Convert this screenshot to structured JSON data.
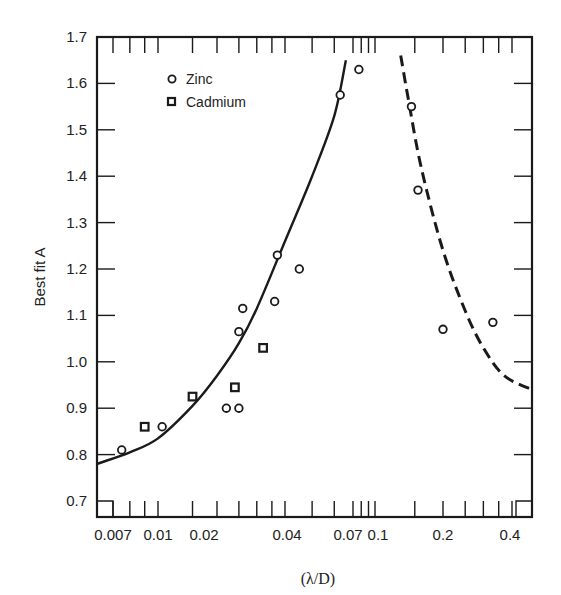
{
  "chart_data": {
    "type": "scatter",
    "title": "",
    "xlabel": "(λ/D)",
    "ylabel": "Best fit A",
    "xscale": "log",
    "xlim": [
      0.0063,
      0.47
    ],
    "ylim": [
      0.67,
      1.7
    ],
    "grid": false,
    "legend_position": "upper-left",
    "x_tick_labels": [
      "0.007",
      "0.01",
      "0.02",
      "0.04",
      "0.07",
      "0.1",
      "0.2",
      "0.4"
    ],
    "y_tick_labels": [
      "0.7",
      "0.8",
      "0.9",
      "1.0",
      "1.1",
      "1.2",
      "1.3",
      "1.4",
      "1.5",
      "1.6",
      "1.7"
    ],
    "legend": [
      {
        "label": "Zinc",
        "marker": "circle"
      },
      {
        "label": "Cadmium",
        "marker": "square"
      }
    ],
    "series": [
      {
        "name": "Zinc",
        "marker": "circle",
        "points": [
          {
            "x": 0.0075,
            "y": 0.81
          },
          {
            "x": 0.0105,
            "y": 0.86
          },
          {
            "x": 0.022,
            "y": 0.9
          },
          {
            "x": 0.025,
            "y": 0.9
          },
          {
            "x": 0.025,
            "y": 1.065
          },
          {
            "x": 0.026,
            "y": 1.115
          },
          {
            "x": 0.036,
            "y": 1.13
          },
          {
            "x": 0.037,
            "y": 1.23
          },
          {
            "x": 0.045,
            "y": 1.2
          },
          {
            "x": 0.063,
            "y": 1.575
          },
          {
            "x": 0.077,
            "y": 1.63
          },
          {
            "x": 0.145,
            "y": 1.55
          },
          {
            "x": 0.155,
            "y": 1.37
          },
          {
            "x": 0.2,
            "y": 1.07
          },
          {
            "x": 0.33,
            "y": 1.085
          }
        ]
      },
      {
        "name": "Cadmium",
        "marker": "square",
        "points": [
          {
            "x": 0.009,
            "y": 0.86
          },
          {
            "x": 0.015,
            "y": 0.925
          },
          {
            "x": 0.024,
            "y": 0.945
          },
          {
            "x": 0.032,
            "y": 1.03
          }
        ]
      },
      {
        "name": "Fit (small λ/D)",
        "style": "solid-line",
        "points": [
          {
            "x": 0.0063,
            "y": 0.78
          },
          {
            "x": 0.008,
            "y": 0.805
          },
          {
            "x": 0.01,
            "y": 0.835
          },
          {
            "x": 0.015,
            "y": 0.905
          },
          {
            "x": 0.02,
            "y": 0.97
          },
          {
            "x": 0.025,
            "y": 1.04
          },
          {
            "x": 0.03,
            "y": 1.115
          },
          {
            "x": 0.04,
            "y": 1.26
          },
          {
            "x": 0.05,
            "y": 1.4
          },
          {
            "x": 0.06,
            "y": 1.53
          },
          {
            "x": 0.066,
            "y": 1.65
          }
        ]
      },
      {
        "name": "Fit (large λ/D)",
        "style": "dashed-line",
        "points": [
          {
            "x": 0.13,
            "y": 1.66
          },
          {
            "x": 0.14,
            "y": 1.57
          },
          {
            "x": 0.16,
            "y": 1.42
          },
          {
            "x": 0.2,
            "y": 1.24
          },
          {
            "x": 0.25,
            "y": 1.11
          },
          {
            "x": 0.3,
            "y": 1.03
          },
          {
            "x": 0.37,
            "y": 0.97
          },
          {
            "x": 0.47,
            "y": 0.94
          }
        ]
      }
    ]
  },
  "labels": {
    "ylabel": "Best fit A",
    "xlabel": "(λ/D)",
    "legend_zinc": "Zinc",
    "legend_cadmium": "Cadmium"
  }
}
